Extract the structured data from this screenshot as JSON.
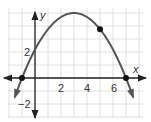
{
  "chart_data": {
    "type": "line",
    "title": "",
    "xlabel": "x",
    "ylabel": "y",
    "x_ticks": [
      2,
      4,
      6
    ],
    "y_ticks": [
      2,
      -2
    ],
    "xlim": [
      -2,
      8
    ],
    "ylim": [
      -3,
      6
    ],
    "grid": true,
    "series": [
      {
        "name": "parabola",
        "equation": "y = -5/16 (x - 3)^2 + 5",
        "vertex": [
          3,
          5
        ],
        "x": [
          -1.5,
          -1,
          0,
          1,
          2,
          3,
          4,
          5,
          6,
          7,
          7.5
        ],
        "values": [
          -1.33,
          0,
          2.19,
          3.75,
          4.69,
          5,
          4.69,
          3.75,
          2.19,
          0,
          -1.33
        ]
      }
    ],
    "points": [
      {
        "x": -1,
        "y": 0
      },
      {
        "x": 5,
        "y": 3.75
      },
      {
        "x": 7,
        "y": 0
      }
    ]
  },
  "labels": {
    "x_axis": "x",
    "y_axis": "y",
    "tick_x_2": "2",
    "tick_x_4": "4",
    "tick_x_6": "6",
    "tick_y_2": "2",
    "tick_y_neg2": "−2"
  },
  "colors": {
    "curve": "#555555",
    "axis": "#222222",
    "grid": "#d8d8d8",
    "point": "#111111"
  }
}
